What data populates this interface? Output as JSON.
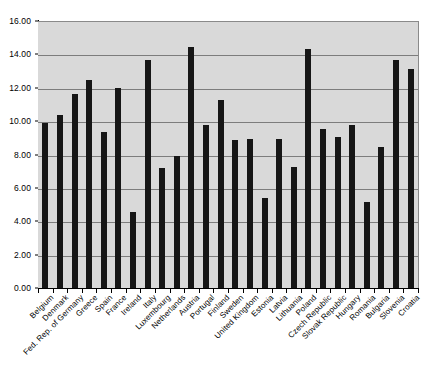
{
  "chart_data": {
    "type": "bar",
    "title": "",
    "subtitle": "",
    "xlabel": "",
    "ylabel": "",
    "ylim": [
      0,
      16
    ],
    "ytick_step": 2,
    "ytick_labels": [
      "0.00",
      "2.00",
      "4.00",
      "6.00",
      "8.00",
      "10.00",
      "12.00",
      "14.00",
      "16.00"
    ],
    "ytick_values": [
      0,
      2,
      4,
      6,
      8,
      10,
      12,
      14,
      16
    ],
    "grid": true,
    "grid_axis": "y",
    "legend": false,
    "legend_position": "none",
    "bar_color": "#161616",
    "plot_background": "#d9d9d9",
    "figure_background": "#ffffff",
    "categories": [
      "Belgium",
      "Denmark",
      "Fed. Rep. of Germany",
      "Greece",
      "Spain",
      "France",
      "Ireland",
      "Italy",
      "Luxembourg",
      "Netherlands",
      "Austria",
      "Portugal",
      "Finland",
      "Sweden",
      "United Kingdom",
      "Estonia",
      "Latvia",
      "Lithuania",
      "Poland",
      "Czech Republic",
      "Slovak Republic",
      "Hungary",
      "Romania",
      "Bulgaria",
      "Slovenia",
      "Croatia"
    ],
    "values": [
      9.95,
      10.45,
      11.7,
      12.55,
      9.4,
      12.05,
      4.6,
      13.75,
      7.25,
      7.95,
      14.5,
      9.8,
      11.3,
      8.95,
      9.0,
      5.45,
      9.0,
      7.3,
      14.4,
      9.6,
      9.1,
      9.8,
      5.2,
      8.5,
      13.7,
      13.2
    ]
  }
}
